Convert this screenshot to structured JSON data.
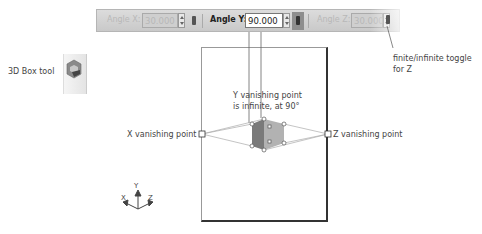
{
  "toolbar": {
    "angle_x": {
      "label": "Angle X:",
      "value": "30.000",
      "state": "disabled"
    },
    "angle_y": {
      "label": "Angle Y:",
      "value": "90.000",
      "state": "active"
    },
    "angle_z": {
      "label": "Angle Z:",
      "value": "30.000",
      "state": "disabled"
    }
  },
  "annotations": {
    "box_tool": "3D Box tool",
    "y_vp_line1": "Y vanishing point",
    "y_vp_line2": "is infinite, at 90°",
    "x_vp": "X vanishing point",
    "z_vp": "Z vanishing point",
    "toggle_line1": "finite/infinite toggle",
    "toggle_line2": "for Z"
  },
  "axes": {
    "x": "X",
    "y": "Y",
    "z": "Z"
  },
  "colors": {
    "toolbar_bg": "#d2d2d2",
    "box_left": "#7a7a7a",
    "box_right": "#b0b0b0",
    "box_top": "#999999"
  }
}
